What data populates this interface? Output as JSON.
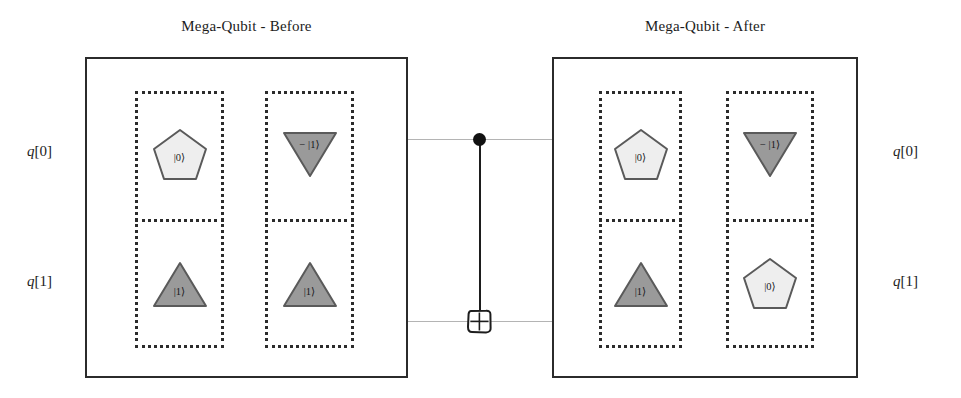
{
  "diagram": {
    "kind": "quantum-circuit-state-diagram",
    "panels": [
      {
        "id": "before",
        "title": "Mega-Qubit - Before",
        "registers": [
          {
            "id": "reg-0",
            "cells": [
              {
                "row": "q[0]",
                "shape": "pentagon",
                "label": "|0⟩",
                "fill": "#eeeeee"
              },
              {
                "row": "q[1]",
                "shape": "triangle-up",
                "label": "|1⟩",
                "fill": "#9a9a9a"
              }
            ]
          },
          {
            "id": "reg-1",
            "cells": [
              {
                "row": "q[0]",
                "shape": "triangle-down",
                "label": "− |1⟩",
                "fill": "#9a9a9a"
              },
              {
                "row": "q[1]",
                "shape": "triangle-up",
                "label": "|1⟩",
                "fill": "#9a9a9a"
              }
            ]
          }
        ]
      },
      {
        "id": "after",
        "title": "Mega-Qubit - After",
        "registers": [
          {
            "id": "reg-0",
            "cells": [
              {
                "row": "q[0]",
                "shape": "pentagon",
                "label": "|0⟩",
                "fill": "#eeeeee"
              },
              {
                "row": "q[1]",
                "shape": "triangle-up",
                "label": "|1⟩",
                "fill": "#9a9a9a"
              }
            ]
          },
          {
            "id": "reg-1",
            "cells": [
              {
                "row": "q[0]",
                "shape": "triangle-down",
                "label": "− |1⟩",
                "fill": "#9a9a9a"
              },
              {
                "row": "q[1]",
                "shape": "pentagon",
                "label": "|0⟩",
                "fill": "#eeeeee"
              }
            ]
          }
        ]
      }
    ],
    "wire_labels": {
      "left": [
        {
          "q": "q",
          "index": "[0]"
        },
        {
          "q": "q",
          "index": "[1]"
        }
      ],
      "right": [
        {
          "q": "q",
          "index": "[0]"
        },
        {
          "q": "q",
          "index": "[1]"
        }
      ]
    },
    "gate": {
      "name": "CNOT",
      "control_row": "q[0]",
      "target_row": "q[1]",
      "target_symbol": "⊕"
    },
    "colors": {
      "ink": "#2b2b2b",
      "wire": "#b4b4b4",
      "shape_light": "#eeeeee",
      "shape_dark": "#9a9a9a",
      "outline": "#4a4a4a"
    }
  }
}
